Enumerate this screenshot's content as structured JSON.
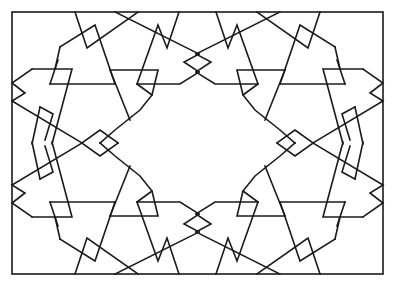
{
  "figure": {
    "title": "Geometric interlaced star pattern",
    "stroke_color": "#1a1a1a",
    "background": "#ffffff",
    "frame": {
      "x": 12,
      "y": 12,
      "width": 371,
      "height": 262
    },
    "symmetry": "mirror about vertical and horizontal center lines",
    "center": {
      "x": 197.5,
      "y": 143
    }
  }
}
